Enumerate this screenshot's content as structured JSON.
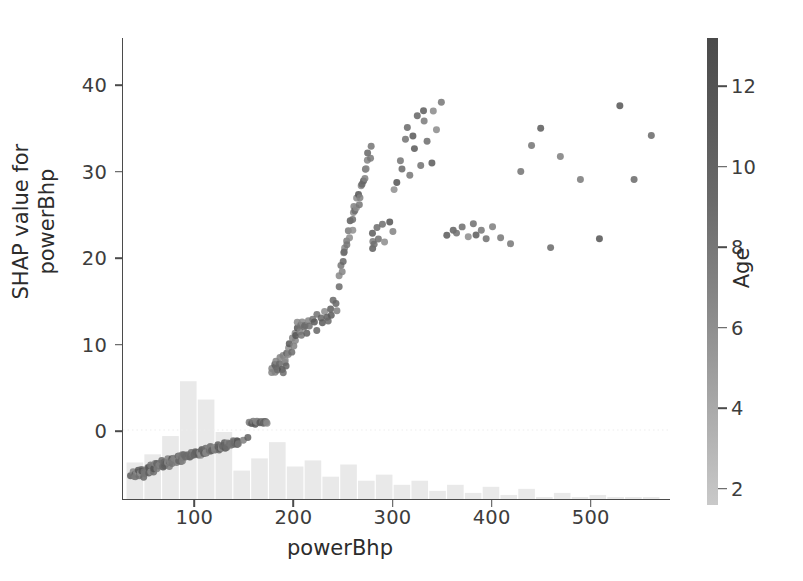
{
  "figure": {
    "background": "#ffffff",
    "axis_color": "#4b4b4b",
    "text_color": "#2c2c2c",
    "point_color_low": "#c9c9c9",
    "point_color_high": "#4a4a4a",
    "hist_color": "#e9e9e9"
  },
  "chart_data": {
    "type": "scatter",
    "title": "",
    "xlabel": "powerBhp",
    "ylabel": "SHAP value for\npowerBhp",
    "ylabel_line1": "SHAP value for",
    "ylabel_line2": "powerBhp",
    "xlim": [
      27,
      580
    ],
    "ylim": [
      -8,
      45.5
    ],
    "xticks": [
      100,
      200,
      300,
      400,
      500
    ],
    "yticks": [
      0,
      10,
      20,
      30,
      40
    ],
    "grid": false,
    "legend": null,
    "colorbar": {
      "label": "Age",
      "ticks": [
        2,
        4,
        6,
        8,
        10,
        12
      ],
      "vmin": 1.6,
      "vmax": 13.2,
      "cmap": "grayscale-light-to-dark",
      "position": "right"
    },
    "marker": {
      "shape": "circle",
      "size_px": 7,
      "alpha": 0.85
    },
    "zero_line": {
      "y": 0,
      "style": "dotted",
      "color": "#ededed"
    },
    "x": [
      34,
      36,
      38,
      39,
      40,
      41,
      42,
      43,
      44,
      45,
      46,
      47,
      47,
      48,
      49,
      50,
      51,
      52,
      53,
      54,
      55,
      56,
      57,
      58,
      58,
      59,
      60,
      61,
      62,
      63,
      64,
      65,
      66,
      67,
      67,
      68,
      69,
      70,
      71,
      72,
      73,
      74,
      74,
      75,
      76,
      77,
      78,
      79,
      80,
      81,
      82,
      83,
      84,
      85,
      86,
      87,
      88,
      88,
      89,
      90,
      91,
      92,
      93,
      94,
      95,
      96,
      97,
      98,
      99,
      100,
      101,
      102,
      103,
      104,
      105,
      106,
      107,
      108,
      109,
      110,
      111,
      112,
      113,
      114,
      115,
      116,
      117,
      118,
      119,
      120,
      121,
      122,
      123,
      124,
      125,
      126,
      127,
      128,
      129,
      130,
      131,
      132,
      133,
      134,
      135,
      136,
      137,
      138,
      139,
      140,
      141,
      142,
      143,
      144,
      145,
      150,
      152,
      154,
      156,
      158,
      160,
      161,
      162,
      163,
      164,
      165,
      166,
      167,
      168,
      169,
      170,
      172,
      174,
      176,
      178,
      180,
      181,
      182,
      183,
      184,
      185,
      186,
      187,
      188,
      189,
      190,
      191,
      192,
      193,
      194,
      195,
      196,
      197,
      198,
      199,
      200,
      201,
      202,
      203,
      204,
      205,
      206,
      207,
      208,
      209,
      210,
      212,
      214,
      216,
      218,
      220,
      222,
      224,
      226,
      228,
      230,
      232,
      234,
      236,
      238,
      240,
      242,
      244,
      245,
      246,
      247,
      248,
      249,
      250,
      251,
      252,
      253,
      254,
      255,
      256,
      257,
      258,
      259,
      260,
      261,
      262,
      263,
      264,
      265,
      266,
      267,
      268,
      269,
      270,
      271,
      272,
      273,
      274,
      275,
      276,
      277,
      278,
      279,
      280,
      282,
      284,
      286,
      288,
      290,
      296,
      300,
      302,
      305,
      308,
      310,
      312,
      315,
      318,
      320,
      322,
      325,
      328,
      330,
      332,
      335,
      338,
      340,
      345,
      350,
      355,
      360,
      365,
      370,
      375,
      380,
      385,
      390,
      395,
      400,
      410,
      420,
      430,
      440,
      450,
      460,
      470,
      490,
      510,
      530,
      545,
      560
    ],
    "y": [
      -5.2,
      -5.0,
      -5.4,
      -5.1,
      -4.9,
      -5.3,
      -5.0,
      -4.8,
      -5.2,
      -4.7,
      -5.1,
      -4.6,
      -5.4,
      -4.9,
      -5.0,
      -4.5,
      -4.8,
      -4.4,
      -5.0,
      -4.3,
      -4.7,
      -4.2,
      -4.6,
      -4.1,
      -5.0,
      -4.4,
      -4.0,
      -4.5,
      -3.9,
      -4.3,
      -4.1,
      -3.8,
      -4.2,
      -3.7,
      -4.4,
      -4.0,
      -3.9,
      -3.6,
      -4.1,
      -3.8,
      -3.5,
      -3.9,
      -4.2,
      -3.7,
      -3.4,
      -3.8,
      -3.6,
      -3.3,
      -3.7,
      -3.5,
      -3.2,
      -3.6,
      -3.4,
      -3.1,
      -3.5,
      -3.3,
      -3.0,
      -3.6,
      -3.2,
      -2.9,
      -3.3,
      -3.1,
      -2.8,
      -3.2,
      -3.0,
      -2.7,
      -3.1,
      -2.9,
      -2.6,
      -3.0,
      -2.8,
      -2.5,
      -2.9,
      -2.7,
      -2.4,
      -2.8,
      -2.6,
      -2.3,
      -2.7,
      -2.5,
      -2.2,
      -2.6,
      -2.4,
      -2.1,
      -2.5,
      -2.3,
      -2.0,
      -2.4,
      -2.2,
      -1.9,
      -2.3,
      -2.1,
      -1.8,
      -2.2,
      -2.0,
      -1.7,
      -2.1,
      -1.9,
      -1.6,
      -2.0,
      -1.8,
      -1.5,
      -1.9,
      -1.7,
      -1.4,
      -1.8,
      -1.6,
      -1.3,
      -1.7,
      -1.5,
      -1.2,
      -1.6,
      -1.4,
      -1.1,
      -1.5,
      -1.3,
      -1.0,
      0.8,
      0.9,
      0.85,
      0.9,
      0.8,
      0.95,
      0.9,
      0.85,
      0.9,
      0.8,
      0.95,
      0.9,
      0.85,
      0.9,
      0.95,
      0.9,
      6.5,
      7.0,
      6.8,
      7.5,
      7.2,
      8.0,
      6.9,
      7.6,
      8.3,
      7.1,
      6.7,
      8.6,
      7.9,
      9.0,
      8.2,
      7.4,
      9.4,
      8.8,
      10.1,
      9.2,
      10.8,
      9.7,
      11.3,
      10.4,
      11.9,
      10.9,
      12.4,
      11.5,
      12.0,
      11.1,
      12.6,
      11.8,
      12.2,
      11.4,
      12.8,
      12.1,
      13.0,
      12.5,
      11.7,
      13.3,
      12.9,
      12.3,
      13.6,
      13.1,
      12.7,
      14.2,
      13.4,
      15.0,
      14.6,
      13.9,
      16.5,
      17.8,
      19.2,
      18.4,
      20.5,
      19.6,
      21.3,
      20.8,
      22.1,
      21.5,
      23.0,
      22.4,
      24.2,
      23.3,
      25.1,
      24.5,
      26.0,
      25.4,
      26.8,
      25.9,
      27.5,
      26.3,
      28.2,
      27.1,
      29.0,
      28.5,
      30.1,
      29.3,
      31.2,
      30.4,
      32.0,
      31.5,
      33.1,
      21.2,
      22.0,
      22.8,
      21.6,
      23.4,
      22.2,
      23.9,
      21.9,
      24.3,
      23.1,
      27.9,
      28.6,
      31.4,
      30.2,
      33.7,
      35.1,
      29.6,
      34.3,
      32.8,
      36.4,
      30.8,
      37.2,
      35.8,
      33.5,
      31.0,
      36.9,
      34.8,
      38.2,
      22.6,
      23.3,
      22.9,
      23.6,
      22.4,
      23.8,
      22.7,
      23.2,
      22.1,
      23.5,
      22.3,
      21.8,
      30.1,
      33.2,
      34.9,
      21.0,
      31.8,
      29.0,
      22.1,
      37.6,
      28.9,
      34.2,
      21.9,
      43.2
    ],
    "histogram": {
      "bin_edges": [
        30,
        48,
        66,
        84,
        102,
        120,
        138,
        156,
        174,
        192,
        210,
        228,
        246,
        264,
        282,
        300,
        318,
        336,
        354,
        372,
        390,
        408,
        426,
        444,
        462,
        480,
        498,
        516,
        534,
        552,
        570
      ],
      "counts": [
        18,
        22,
        31,
        58,
        49,
        33,
        14,
        20,
        28,
        16,
        19,
        11,
        17,
        9,
        12,
        7,
        9,
        4,
        7,
        3,
        6,
        2,
        5,
        1,
        3,
        1,
        2,
        1,
        1,
        1
      ],
      "note": "faint light-gray density bars along the bottom of the axes"
    }
  },
  "colorbar_labels": [
    "12",
    "10",
    "8",
    "6",
    "4",
    "2"
  ],
  "axis": {
    "ylabel_line1": "SHAP value for",
    "ylabel_line2": "powerBhp",
    "xlabel": "powerBhp",
    "colorbar_title": "Age"
  }
}
